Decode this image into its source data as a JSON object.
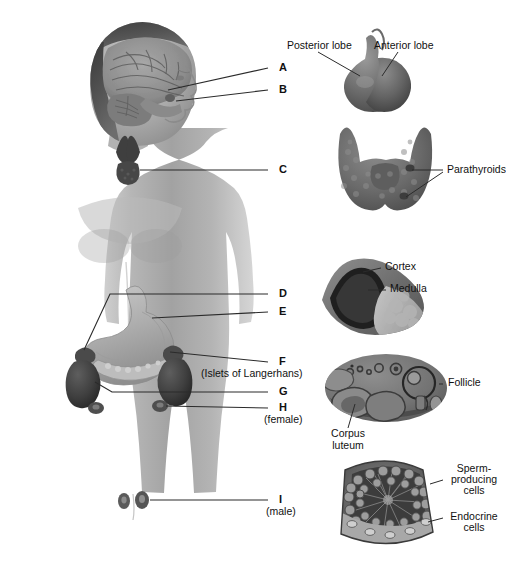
{
  "figure": {
    "background": "#ffffff",
    "line_color": "#2b2b2b",
    "body_tone": "#a9a9a9",
    "organ_tone": "#6e6e6e"
  },
  "body_labels": {
    "a": "A",
    "b": "B",
    "c": "C",
    "d": "D",
    "e": "E",
    "f": "F",
    "f_sub": "(Islets of Langerhans)",
    "g": "G",
    "h": "H",
    "h_sub": "(female)",
    "i": "I",
    "i_sub": "(male)"
  },
  "callouts": {
    "pituitary": {
      "posterior": "Posterior lobe",
      "anterior": "Anterior lobe"
    },
    "thyroid": {
      "parathyroids": "Parathyroids"
    },
    "adrenal": {
      "cortex": "Cortex",
      "medulla": "Medulla"
    },
    "ovary": {
      "follicle": "Follicle",
      "corpus_luteum_line1": "Corpus",
      "corpus_luteum_line2": "luteum"
    },
    "testis": {
      "sperm_line1": "Sperm-",
      "sperm_line2": "producing",
      "sperm_line3": "cells",
      "endocrine_line1": "Endocrine",
      "endocrine_line2": "cells"
    }
  },
  "panels": [
    {
      "name": "pituitary-gland",
      "letter": "B"
    },
    {
      "name": "thyroid-gland",
      "letter": "C"
    },
    {
      "name": "adrenal-gland",
      "letter": "D"
    },
    {
      "name": "ovary",
      "letter": "H"
    },
    {
      "name": "testis",
      "letter": "I"
    }
  ]
}
